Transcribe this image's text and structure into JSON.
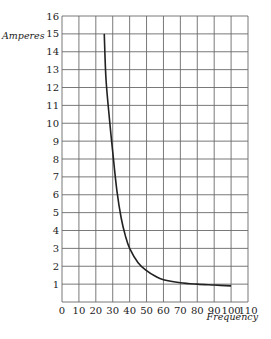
{
  "chart_data": {
    "type": "line",
    "title": "",
    "xlabel": "Frequency",
    "ylabel": "Amperes",
    "xlim": [
      0,
      110
    ],
    "ylim": [
      0,
      16
    ],
    "grid": true,
    "legend": null,
    "x_ticks": [
      0,
      10,
      20,
      30,
      40,
      50,
      60,
      70,
      80,
      90,
      100,
      110
    ],
    "y_ticks": [
      1,
      2,
      3,
      4,
      5,
      6,
      7,
      8,
      9,
      10,
      11,
      12,
      13,
      14,
      15,
      16
    ],
    "series": [
      {
        "name": "Amperes vs Frequency",
        "x": [
          25,
          26,
          28,
          30,
          32.5,
          35,
          37.5,
          40,
          45,
          50,
          55,
          60,
          70,
          80,
          90,
          100
        ],
        "y": [
          15,
          12.5,
          10.3,
          8.4,
          6.2,
          4.7,
          3.7,
          3.0,
          2.2,
          1.75,
          1.45,
          1.25,
          1.08,
          1.0,
          0.95,
          0.9
        ]
      }
    ]
  }
}
